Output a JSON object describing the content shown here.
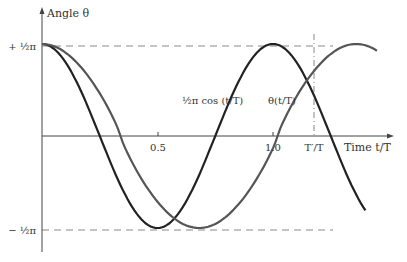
{
  "chart_data": {
    "type": "line",
    "title": "",
    "xlabel": "Time t/T",
    "ylabel": "Angle θ",
    "x_ticks": [
      {
        "value": 0.5,
        "label": "0.5"
      },
      {
        "value": 1.0,
        "label": "1.0"
      },
      {
        "value": 1.36,
        "label": "T′/T"
      }
    ],
    "y_ticks": [
      {
        "value": 1.5708,
        "label": "+ ½π"
      },
      {
        "value": -1.5708,
        "label": "− ½π"
      }
    ],
    "xlim": [
      0,
      1.65
    ],
    "ylim": [
      -1.5708,
      1.5708
    ],
    "grid": false,
    "reference_lines": [
      {
        "orientation": "horizontal",
        "value": 1.5708,
        "style": "dashed"
      },
      {
        "orientation": "horizontal",
        "value": -1.5708,
        "style": "dashed"
      },
      {
        "orientation": "vertical",
        "value": 1.36,
        "style": "dash-dot"
      }
    ],
    "series": [
      {
        "name": "½π cos(t/T)",
        "label": "½π cos (t/T)",
        "color": "#222222",
        "description": "small-angle approximation, period T",
        "x": [
          0,
          0.1,
          0.2,
          0.25,
          0.3,
          0.4,
          0.5,
          0.6,
          0.7,
          0.75,
          0.8,
          0.9,
          1.0,
          1.1,
          1.2,
          1.25,
          1.3,
          1.4
        ],
        "y": [
          1.571,
          1.271,
          0.485,
          0.0,
          -0.485,
          -1.271,
          -1.571,
          -1.271,
          -0.485,
          0.0,
          0.485,
          1.271,
          1.571,
          1.271,
          0.485,
          0.0,
          -0.485,
          -1.271
        ]
      },
      {
        "name": "θ(t/T)",
        "label": "θ(t/T)",
        "color": "#555555",
        "description": "exact pendulum solution, period T′",
        "x": [
          0,
          0.1,
          0.2,
          0.3,
          0.34,
          0.4,
          0.5,
          0.6,
          0.68,
          0.8,
          0.9,
          1.0,
          1.02,
          1.1,
          1.2,
          1.3,
          1.36,
          1.45
        ],
        "y": [
          1.571,
          1.34,
          0.78,
          0.16,
          0.0,
          -0.5,
          -1.2,
          -1.52,
          -1.571,
          -1.33,
          -0.76,
          -0.1,
          0.0,
          0.6,
          1.2,
          1.5,
          1.571,
          1.45
        ]
      }
    ],
    "annotations": [
      {
        "text": "½π cos (t/T)",
        "near_x": 0.8,
        "near_y": 0.75
      },
      {
        "text": "θ(t/T)",
        "near_x": 1.05,
        "near_y": 0.75
      }
    ]
  },
  "labels": {
    "y_axis": "Angle θ",
    "x_axis": "Time t/T",
    "y_top": "+ ½π",
    "y_bottom": "− ½π",
    "tick_05": "0.5",
    "tick_10": "1.0",
    "tick_tp": "T′/T",
    "curve_cos": "½π cos (t/T)",
    "curve_theta": "θ(t/T)"
  },
  "colors": {
    "axis": "#444444",
    "dashed": "#777777",
    "curve_cos": "#222222",
    "curve_theta": "#555555",
    "text": "#333333"
  }
}
